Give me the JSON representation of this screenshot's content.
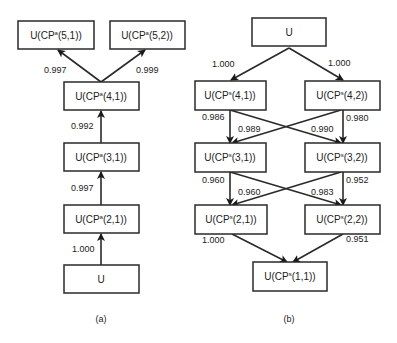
{
  "panel_a": {
    "caption": "(a)",
    "nodes": {
      "n51": {
        "pre": "U(CP",
        "sup": "a",
        "post": "(5,1))"
      },
      "n52": {
        "pre": "U(CP",
        "sup": "a",
        "post": "(5,2))"
      },
      "n41": {
        "pre": "U(CP",
        "sup": "a",
        "post": "(4,1))"
      },
      "n31": {
        "pre": "U(CP",
        "sup": "a",
        "post": "(3,1))"
      },
      "n21": {
        "pre": "U(CP",
        "sup": "a",
        "post": "(2,1))"
      },
      "u": {
        "pre": "U",
        "sup": "",
        "post": ""
      }
    },
    "edges": {
      "e41_51": "0.997",
      "e41_52": "0.999",
      "e31_41": "0.992",
      "e21_31": "0.997",
      "u_21": "1.000"
    }
  },
  "panel_b": {
    "caption": "(b)",
    "nodes": {
      "u": {
        "pre": "U",
        "sup": "",
        "post": ""
      },
      "n41": {
        "pre": "U(CP",
        "sup": "s",
        "post": "(4,1))"
      },
      "n42": {
        "pre": "U(CP",
        "sup": "s",
        "post": "(4,2))"
      },
      "n31": {
        "pre": "U(CP",
        "sup": "s",
        "post": "(3,1))"
      },
      "n32": {
        "pre": "U(CP",
        "sup": "s",
        "post": "(3,2))"
      },
      "n21": {
        "pre": "U(CP",
        "sup": "s",
        "post": "(2,1))"
      },
      "n22": {
        "pre": "U(CP",
        "sup": "s",
        "post": "(2,2))"
      },
      "n11": {
        "pre": "U(CP",
        "sup": "s",
        "post": "(1,1))"
      }
    },
    "edges": {
      "u_41": "1.000",
      "u_42": "1.000",
      "n41_31": "0.986",
      "n41_32": "0.990",
      "n42_31": "0.989",
      "n42_32": "0.980",
      "n31_21": "0.960",
      "n31_22": "0.983",
      "n32_21": "0.960",
      "n32_22": "0.952",
      "n21_11": "1.000",
      "n22_11": "0.951"
    }
  }
}
